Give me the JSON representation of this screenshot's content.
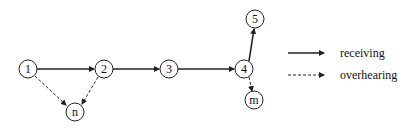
{
  "diagram": {
    "nodes": [
      {
        "id": "1",
        "label": "1",
        "x": 28,
        "y": 69
      },
      {
        "id": "2",
        "label": "2",
        "x": 104,
        "y": 69
      },
      {
        "id": "3",
        "label": "3",
        "x": 169,
        "y": 69
      },
      {
        "id": "4",
        "label": "4",
        "x": 244,
        "y": 69
      },
      {
        "id": "5",
        "label": "5",
        "x": 254,
        "y": 19
      },
      {
        "id": "n",
        "label": "n",
        "x": 75,
        "y": 112
      },
      {
        "id": "m",
        "label": "m",
        "x": 254,
        "y": 101
      }
    ],
    "edges": [
      {
        "from": "1",
        "to": "2",
        "type": "receiving"
      },
      {
        "from": "2",
        "to": "3",
        "type": "receiving"
      },
      {
        "from": "3",
        "to": "4",
        "type": "receiving"
      },
      {
        "from": "4",
        "to": "5",
        "type": "receiving"
      },
      {
        "from": "1",
        "to": "n",
        "type": "overhearing"
      },
      {
        "from": "2",
        "to": "n",
        "type": "overhearing"
      },
      {
        "from": "4",
        "to": "m",
        "type": "overhearing"
      }
    ],
    "legend": {
      "receiving": "receiving",
      "overhearing": "overhearing"
    },
    "colors": {
      "stroke": "#222222",
      "background": "#ffffff"
    }
  }
}
